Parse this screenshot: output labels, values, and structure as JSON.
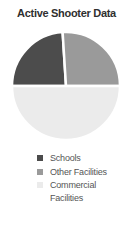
{
  "title": "Active Shooter Data",
  "chart_data": {
    "type": "pie",
    "title": "Active Shooter Data",
    "labels": [
      "Schools",
      "Other Facilities",
      "Commercial Facilities"
    ],
    "values": [
      24,
      26,
      50
    ],
    "unit": "percent (estimated from slice angles)",
    "colors": [
      "#4c4c4c",
      "#9a9a9a",
      "#ebebeb"
    ],
    "start_angle_deg": -90,
    "direction": "clockwise",
    "separator_color": "#ffffff",
    "legend_position": "bottom-left",
    "data_labels": "none"
  },
  "legend": {
    "items": [
      {
        "label": "Schools",
        "color": "#4c4c4c"
      },
      {
        "label": "Other Facilities",
        "color": "#9a9a9a"
      },
      {
        "label": "Commercial Facilities",
        "color": "#ebebeb"
      }
    ]
  },
  "colors": {
    "background": "#ffffff",
    "title_text": "#2f2f2f",
    "legend_text": "#555555"
  }
}
